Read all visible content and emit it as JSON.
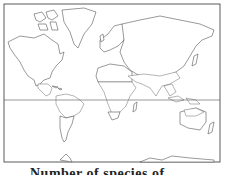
{
  "map": {
    "title": "World map showing tropical distribution (shaded regions)",
    "projection": "Mercator",
    "shade_color": "#8a8a8a",
    "land_color": "#ffffff",
    "outline_color": "#555555",
    "reference_lines": [
      "equator"
    ],
    "shaded_regions": [
      {
        "name": "Mexico / Central America"
      },
      {
        "name": "Northern South America"
      },
      {
        "name": "Sub-Saharan / Central Africa"
      },
      {
        "name": "Arabian Peninsula / South Asia"
      },
      {
        "name": "Southeast Asia / Indonesia"
      },
      {
        "name": "Northern Australia"
      }
    ]
  },
  "caption": {
    "text": "Number of species of ...",
    "note": "caption partially cut off at bottom edge"
  }
}
